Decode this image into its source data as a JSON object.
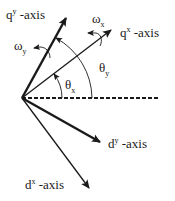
{
  "diagram": {
    "ink_color": "#1a1a1a",
    "axes": [
      {
        "id": "qy",
        "base": "q",
        "sup": "y",
        "suffix": " -axis",
        "style": "thick"
      },
      {
        "id": "qx",
        "base": "q",
        "sup": "x",
        "suffix": " -axis",
        "style": "thin"
      },
      {
        "id": "dy",
        "base": "d",
        "sup": "y",
        "suffix": " -axis",
        "style": "thick"
      },
      {
        "id": "dx",
        "base": "d",
        "sup": "x",
        "suffix": " -axis",
        "style": "thin"
      }
    ],
    "reference_line": {
      "style": "dashed"
    },
    "angles": [
      {
        "id": "theta_x",
        "symbol": "θ",
        "sub": "x"
      },
      {
        "id": "theta_y",
        "symbol": "θ",
        "sub": "y"
      }
    ],
    "rotations": [
      {
        "id": "omega_x",
        "symbol": "ω",
        "sub": "x"
      },
      {
        "id": "omega_y",
        "symbol": "ω",
        "sub": "y"
      }
    ]
  }
}
